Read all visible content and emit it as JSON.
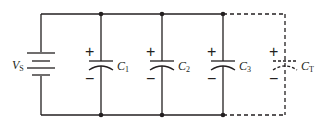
{
  "diagram": {
    "type": "circuit-schematic",
    "colors": {
      "wire": "#231f20",
      "background": "#ffffff"
    },
    "source": {
      "label": "V",
      "subscript": "S"
    },
    "capacitors": [
      {
        "label": "C",
        "subscript": "1",
        "plus": "+",
        "minus": "−",
        "dashed": false
      },
      {
        "label": "C",
        "subscript": "2",
        "plus": "+",
        "minus": "−",
        "dashed": false
      },
      {
        "label": "C",
        "subscript": "3",
        "plus": "+",
        "minus": "−",
        "dashed": false
      },
      {
        "label": "C",
        "subscript": "T",
        "plus": "+",
        "minus": "−",
        "dashed": true
      }
    ]
  }
}
